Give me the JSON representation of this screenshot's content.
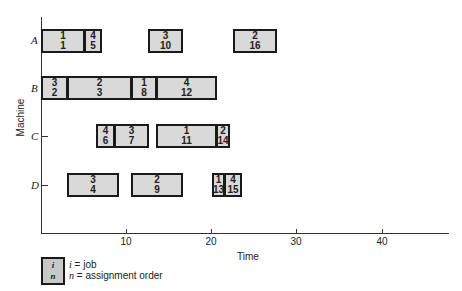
{
  "chart_data": {
    "type": "gantt",
    "title": "",
    "xlabel": "Time",
    "ylabel": "Machine",
    "xlim": [
      0,
      47
    ],
    "xticks": [
      10,
      20,
      30,
      40
    ],
    "machines": [
      "A",
      "B",
      "C",
      "D"
    ],
    "tasks": [
      {
        "machine": "A",
        "job": "1",
        "order": "1",
        "start": 0,
        "end": 5
      },
      {
        "machine": "A",
        "job": "4",
        "order": "5",
        "start": 5,
        "end": 7
      },
      {
        "machine": "A",
        "job": "3",
        "order": "10",
        "start": 12.5,
        "end": 16.5
      },
      {
        "machine": "A",
        "job": "2",
        "order": "16",
        "start": 22.5,
        "end": 27.5
      },
      {
        "machine": "B",
        "job": "3",
        "order": "2",
        "start": 0,
        "end": 3
      },
      {
        "machine": "B",
        "job": "2",
        "order": "3",
        "start": 3,
        "end": 10.5
      },
      {
        "machine": "B",
        "job": "1",
        "order": "8",
        "start": 10.5,
        "end": 13.5
      },
      {
        "machine": "B",
        "job": "4",
        "order": "12",
        "start": 13.5,
        "end": 20.5
      },
      {
        "machine": "C",
        "job": "4",
        "order": "6",
        "start": 6.5,
        "end": 8.5
      },
      {
        "machine": "C",
        "job": "3",
        "order": "7",
        "start": 8.5,
        "end": 12.5
      },
      {
        "machine": "C",
        "job": "1",
        "order": "11",
        "start": 13.5,
        "end": 20.5
      },
      {
        "machine": "C",
        "job": "2",
        "order": "14",
        "start": 20.5,
        "end": 22
      },
      {
        "machine": "D",
        "job": "3",
        "order": "4",
        "start": 3,
        "end": 9
      },
      {
        "machine": "D",
        "job": "2",
        "order": "9",
        "start": 10.5,
        "end": 16.5
      },
      {
        "machine": "D",
        "job": "1",
        "order": "13",
        "start": 20,
        "end": 21.5
      },
      {
        "machine": "D",
        "job": "4",
        "order": "15",
        "start": 21.5,
        "end": 23.5
      }
    ],
    "legend": {
      "box_top": "i",
      "box_bottom": "n",
      "line1_var": "i",
      "line1_text": " = job",
      "line2_var": "n",
      "line2_text": " = assignment order"
    },
    "grid": false
  },
  "axis": {
    "xlabel": "Time",
    "ylabel": "Machine",
    "ticks": [
      "10",
      "20",
      "30",
      "40"
    ],
    "rows": [
      "A",
      "B",
      "C",
      "D"
    ]
  },
  "legend": {
    "box_top": "i",
    "box_bottom": "n",
    "line1_var": "i",
    "line1_text": " = job",
    "line2_var": "n",
    "line2_text": " = assignment order"
  }
}
